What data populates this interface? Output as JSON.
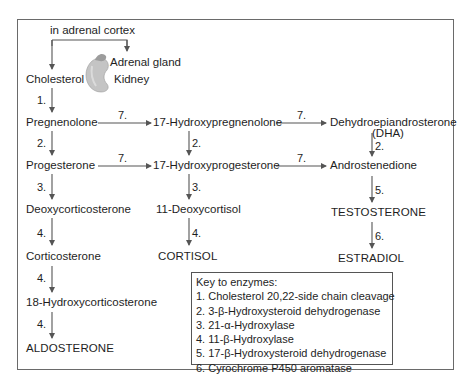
{
  "diagram": {
    "header_label": "in adrenal cortex",
    "organ": {
      "adrenal_label": "Adrenal gland",
      "kidney_label": "Kidney"
    },
    "left_column": [
      {
        "id": "cholesterol",
        "label": "Cholesterol"
      },
      {
        "id": "pregnenolone",
        "label": "Pregnenolone"
      },
      {
        "id": "progesterone",
        "label": "Progesterone"
      },
      {
        "id": "deoxycorticosterone",
        "label": "Deoxycorticosterone"
      },
      {
        "id": "corticosterone",
        "label": "Corticosterone"
      },
      {
        "id": "hydroxycorticosterone",
        "label": "18-Hydroxycorticosterone"
      },
      {
        "id": "aldosterone",
        "label": "ALDOSTERONE"
      }
    ],
    "middle_column": [
      {
        "id": "hydroxypregnenolone",
        "label": "17-Hydroxypregnenolone"
      },
      {
        "id": "hydroxyprogesterone",
        "label": "17-Hydroxyprogesterone"
      },
      {
        "id": "deoxycortisol",
        "label": "11-Deoxycortisol"
      },
      {
        "id": "cortisol",
        "label": "CORTISOL"
      }
    ],
    "right_column": [
      {
        "id": "dha",
        "label": "Dehydroepiandrosterone",
        "sublabel": "(DHA)"
      },
      {
        "id": "androstenedione",
        "label": "Androstenedione"
      },
      {
        "id": "testosterone",
        "label": "TESTOSTERONE"
      },
      {
        "id": "estradiol",
        "label": "ESTRADIOL"
      }
    ],
    "arrow_labels": {
      "cholesterol_to_pregnenolone": "1.",
      "pregnenolone_to_progesterone": "2.",
      "progesterone_to_deoxycorticosterone": "3.",
      "deoxycorticosterone_to_corticosterone": "4.",
      "corticosterone_to_hydroxycorticosterone": "4.",
      "hydroxycorticosterone_to_aldosterone": "4.",
      "pregnenolone_to_hydroxypregnenolone": "7.",
      "progesterone_to_hydroxyprogesterone": "7.",
      "hydroxypregnenolone_to_hydroxyprogesterone": "2.",
      "hydroxyprogesterone_to_deoxycortisol": "3.",
      "deoxycortisol_to_cortisol": "4.",
      "hydroxypregnenolone_to_dha": "7.",
      "hydroxyprogesterone_to_androstenedione": "7.",
      "dha_to_androstenedione": "2.",
      "androstenedione_to_testosterone": "5.",
      "testosterone_to_estradiol": "6."
    },
    "key": {
      "title": "Key to enzymes:",
      "items": [
        "1. Cholesterol 20,22-side chain cleavage",
        "2. 3-β-Hydroxysteroid dehydrogenase",
        "3. 21-α-Hydroxylase",
        "4. 11-β-Hydroxylase",
        "5. 17-β-Hydroxysteroid dehydrogenase",
        "6. Cyrochrome P450 aromatase"
      ]
    },
    "colors": {
      "line": "#555555",
      "frame": "#6a6a6a",
      "organ_fill": "#c8c8c8",
      "text": "#1e1e1e"
    }
  }
}
